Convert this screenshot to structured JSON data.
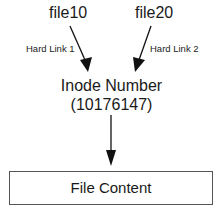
{
  "diagram": {
    "nodes": {
      "file1": {
        "label": "file10"
      },
      "file2": {
        "label": "file20"
      },
      "inode": {
        "line1": "Inode Number",
        "line2": "(10176147)"
      },
      "content": {
        "label": "File Content"
      }
    },
    "edges": [
      {
        "from": "file10",
        "to": "Inode Number",
        "label": "Hard Link 1"
      },
      {
        "from": "file20",
        "to": "Inode Number",
        "label": "Hard Link 2"
      },
      {
        "from": "Inode Number",
        "to": "File Content",
        "label": ""
      }
    ],
    "colors": {
      "line": "#111111",
      "box_border": "#555555",
      "text": "#1a1a1a"
    }
  }
}
